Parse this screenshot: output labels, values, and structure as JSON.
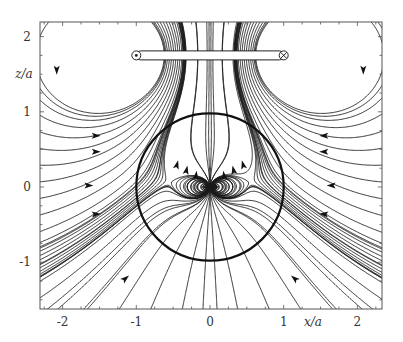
{
  "figure": {
    "xlabel": "x/a",
    "ylabel": "z/a",
    "xlim": [
      -2.3,
      2.35
    ],
    "ylim": [
      -1.63,
      2.2
    ],
    "x_ticks": [
      {
        "value": -2,
        "label": "-2"
      },
      {
        "value": -1,
        "label": "-1"
      },
      {
        "value": 0,
        "label": "0"
      },
      {
        "value": 1,
        "label": "1"
      },
      {
        "value": 2,
        "label": "2"
      }
    ],
    "y_ticks": [
      {
        "value": 2,
        "label": "2"
      },
      {
        "value": 1,
        "label": "1"
      },
      {
        "value": 0,
        "label": "0"
      },
      {
        "value": -1,
        "label": "-1"
      }
    ],
    "sphere": {
      "center": [
        0,
        0
      ],
      "radius": 1
    },
    "ring": {
      "z": 1.75,
      "x_left": -1,
      "x_right": 1,
      "left_symbol": "current-out-of-page",
      "right_symbol": "current-into-page"
    },
    "colors": {
      "line": "#1a1a1a",
      "frame": "#555555",
      "background": "#ffffff"
    }
  }
}
